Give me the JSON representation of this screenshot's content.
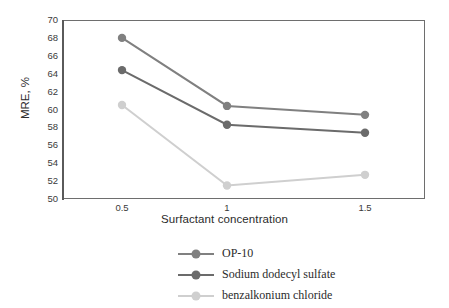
{
  "chart_data": {
    "type": "line",
    "title": "",
    "xlabel": "Surfactant concentration",
    "ylabel": "MRE, %",
    "x": [
      0.5,
      1,
      1.5
    ],
    "xticklabels": [
      "0.5",
      "1",
      "1.5"
    ],
    "ylim": [
      50,
      70
    ],
    "yticks": [
      50,
      52,
      54,
      56,
      58,
      60,
      62,
      64,
      66,
      68,
      70
    ],
    "yticklabels": [
      "50",
      "52",
      "54",
      "56",
      "58",
      "60",
      "62",
      "64",
      "66",
      "68",
      "70"
    ],
    "grid": false,
    "legend_position": "below",
    "series": [
      {
        "name": "OP-10",
        "values": [
          68.0,
          60.4,
          59.4
        ],
        "color": "#808080",
        "marker": "circle"
      },
      {
        "name": "Sodium dodecyl sulfate",
        "values": [
          64.4,
          58.3,
          57.4
        ],
        "color": "#6b6b6b",
        "marker": "circle"
      },
      {
        "name": "benzalkonium chloride",
        "values": [
          60.5,
          51.5,
          52.7
        ],
        "color": "#cfcfcf",
        "marker": "circle"
      }
    ]
  },
  "axes": {
    "x_title": "Surfactant concentration",
    "y_title": "MRE, %",
    "xticklabels": [
      "0.5",
      "1",
      "1.5"
    ],
    "yticklabels": [
      "70",
      "68",
      "66",
      "64",
      "62",
      "60",
      "58",
      "56",
      "54",
      "52",
      "50"
    ]
  },
  "legend": {
    "entries": [
      {
        "label": "OP-10",
        "color": "#808080"
      },
      {
        "label": "Sodium dodecyl sulfate",
        "color": "#6b6b6b"
      },
      {
        "label": "benzalkonium chloride",
        "color": "#cfcfcf"
      }
    ]
  },
  "colors": {
    "frame": "#6e6e6e",
    "tick_text": "#3a3a3a",
    "title_text": "#2b2b2b",
    "background": "#ffffff"
  }
}
